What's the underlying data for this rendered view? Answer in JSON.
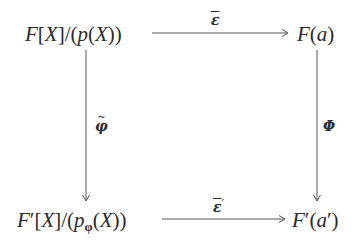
{
  "diagram": {
    "type": "commutative-square",
    "nodes": {
      "top_left": {
        "F": "F",
        "open_bracket": "[",
        "X1": "X",
        "close_bracket": "]",
        "slash": "/",
        "open_paren1": "(",
        "p": "p",
        "open_paren2": "(",
        "X2": "X",
        "close_parens": "))"
      },
      "top_right": {
        "F": "F",
        "open_paren": "(",
        "a": "a",
        "close_paren": ")"
      },
      "bottom_left": {
        "F": "F",
        "prime": "′",
        "open_bracket": "[",
        "X1": "X",
        "close_bracket": "]",
        "slash": "/",
        "open_paren1": "(",
        "p": "p",
        "subscript": "φ",
        "open_paren2": "(",
        "X2": "X",
        "close_parens": "))"
      },
      "bottom_right": {
        "F": "F",
        "prime": "′",
        "open_paren": "(",
        "a": "a",
        "a_prime": "′",
        "close_paren": ")"
      }
    },
    "arrows": {
      "top": {
        "from": "top_left",
        "to": "top_right",
        "label": "ε",
        "label_decoration": "overline"
      },
      "bottom": {
        "from": "bottom_left",
        "to": "bottom_right",
        "label": "ε",
        "label_prime": "′",
        "label_decoration": "overline"
      },
      "left": {
        "from": "top_left",
        "to": "bottom_left",
        "label": "φ",
        "label_decoration": "tilde",
        "tilde": "~"
      },
      "right": {
        "from": "top_right",
        "to": "bottom_right",
        "label": "Φ"
      }
    },
    "colors": {
      "ink": "#2b2b2b",
      "line": "#555555",
      "background": "#ffffff"
    }
  }
}
